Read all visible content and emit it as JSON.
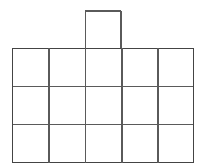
{
  "figure": {
    "background_color": "#ffffff",
    "line_color": "#5a5a5a",
    "line_color_dark": "#444444",
    "line_width": 1.6,
    "canvas": {
      "width": 203,
      "height": 168
    }
  },
  "grid": {
    "columns": 5,
    "rows": 3,
    "total_cells": 15,
    "left": 12,
    "top": 48,
    "right": 194,
    "bottom": 163,
    "cell_width": 36.4,
    "cell_height": 38.333,
    "vertical_line_x": [
      12,
      48.4,
      84.8,
      121.2,
      157.6,
      194
    ],
    "horizontal_line_y": [
      48,
      86.33,
      124.67,
      163
    ]
  },
  "tab": {
    "label": "top square",
    "attached_to_column": 3,
    "left": 84.8,
    "top": 11,
    "right": 121.2,
    "bottom": 48,
    "width": 36.4,
    "height": 37
  },
  "cells": [
    {
      "row": 1,
      "col": 1,
      "name": "cell-r1c1"
    },
    {
      "row": 1,
      "col": 2,
      "name": "cell-r1c2"
    },
    {
      "row": 1,
      "col": 3,
      "name": "cell-r1c3"
    },
    {
      "row": 1,
      "col": 4,
      "name": "cell-r1c4"
    },
    {
      "row": 1,
      "col": 5,
      "name": "cell-r1c5"
    },
    {
      "row": 2,
      "col": 1,
      "name": "cell-r2c1"
    },
    {
      "row": 2,
      "col": 2,
      "name": "cell-r2c2"
    },
    {
      "row": 2,
      "col": 3,
      "name": "cell-r2c3"
    },
    {
      "row": 2,
      "col": 4,
      "name": "cell-r2c4"
    },
    {
      "row": 2,
      "col": 5,
      "name": "cell-r2c5"
    },
    {
      "row": 3,
      "col": 1,
      "name": "cell-r3c1"
    },
    {
      "row": 3,
      "col": 2,
      "name": "cell-r3c2"
    },
    {
      "row": 3,
      "col": 3,
      "name": "cell-r3c3"
    },
    {
      "row": 3,
      "col": 4,
      "name": "cell-r3c4"
    },
    {
      "row": 3,
      "col": 5,
      "name": "cell-r3c5"
    }
  ]
}
